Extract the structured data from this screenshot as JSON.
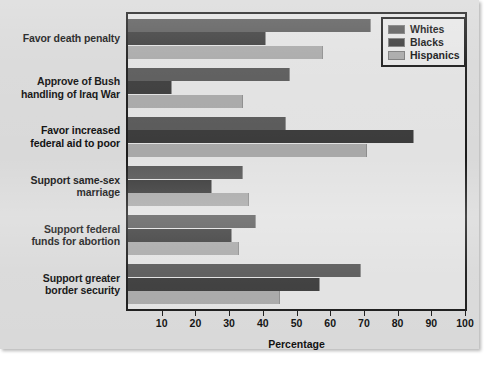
{
  "chart_data": {
    "type": "bar",
    "orientation": "horizontal",
    "title": "",
    "xlabel": "Percentage",
    "ylabel": "",
    "xlim": [
      0,
      100
    ],
    "xticks": [
      10,
      20,
      30,
      40,
      50,
      60,
      70,
      80,
      90,
      100
    ],
    "grid": false,
    "legend_position": "top-right",
    "categories": [
      "Favor death penalty",
      "Approve of Bush handling of Iraq War",
      "Favor increased federal aid to poor",
      "Support same-sex marriage",
      "Support federal funds for abortion",
      "Support greater border security"
    ],
    "category_lines": [
      [
        "Favor death penalty"
      ],
      [
        "Approve of Bush",
        "handling of Iraq War"
      ],
      [
        "Favor increased",
        "federal aid to poor"
      ],
      [
        "Support same-sex",
        "marriage"
      ],
      [
        "Support federal",
        "funds for abortion"
      ],
      [
        "Support greater",
        "border security"
      ]
    ],
    "series": [
      {
        "name": "Whites",
        "color": "#595959",
        "values": [
          72,
          48,
          47,
          34,
          38,
          69
        ]
      },
      {
        "name": "Blacks",
        "color": "#3a3a3a",
        "values": [
          41,
          13,
          85,
          25,
          31,
          57
        ]
      },
      {
        "name": "Hispanics",
        "color": "#a8a8a8",
        "values": [
          58,
          34,
          71,
          36,
          33,
          45
        ]
      }
    ]
  },
  "legend": {
    "items": [
      {
        "label": "Whites"
      },
      {
        "label": "Blacks"
      },
      {
        "label": "Hispanics"
      }
    ]
  },
  "axis": {
    "x_title": "Percentage",
    "tick_labels": [
      "10",
      "20",
      "30",
      "40",
      "50",
      "60",
      "70",
      "80",
      "90",
      "100"
    ]
  }
}
